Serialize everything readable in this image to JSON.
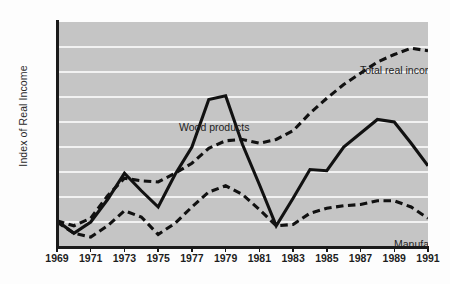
{
  "chart_data": {
    "type": "line",
    "title": "",
    "subtitle": "",
    "xlabel": "",
    "ylabel": "Index of Real Income",
    "xlim": [
      1969,
      1991
    ],
    "ylim": [
      0.9,
      1.8
    ],
    "grid": true,
    "gridline_axis": "y",
    "legend_position": "inline-annotations",
    "background_color": "#c5c5c5",
    "gridline_color": "#f2f2f2",
    "line_color": "#111111",
    "x": [
      1969,
      1970,
      1971,
      1972,
      1973,
      1974,
      1975,
      1976,
      1977,
      1978,
      1979,
      1980,
      1981,
      1982,
      1983,
      1984,
      1985,
      1986,
      1987,
      1988,
      1989,
      1990,
      1991
    ],
    "x_tick_labels": [
      "1969",
      "1971",
      "1973",
      "1975",
      "1977",
      "1979",
      "1981",
      "1983",
      "1985",
      "1987",
      "1989",
      "1991"
    ],
    "y_tick_labels": [
      "0.9",
      "1.0",
      "1.1",
      "1.2",
      "1.3",
      "1.4",
      "1.5",
      "1.6",
      "1.7",
      "1.8"
    ],
    "series": [
      {
        "name": "Total real income",
        "style": "dashed",
        "label_text": "Total real income",
        "values": [
          1.005,
          0.985,
          1.015,
          1.105,
          1.175,
          1.165,
          1.16,
          1.195,
          1.235,
          1.295,
          1.325,
          1.33,
          1.315,
          1.33,
          1.365,
          1.435,
          1.495,
          1.55,
          1.595,
          1.64,
          1.67,
          1.695,
          1.685
        ]
      },
      {
        "name": "Wood products",
        "style": "solid",
        "label_text": "Wood products",
        "values": [
          1.005,
          0.955,
          1.0,
          1.09,
          1.195,
          1.125,
          1.06,
          1.19,
          1.3,
          1.49,
          1.505,
          1.31,
          1.15,
          0.985,
          1.095,
          1.21,
          1.205,
          1.3,
          1.355,
          1.41,
          1.4,
          1.315,
          1.225
        ]
      },
      {
        "name": "Manufacturing",
        "style": "dashed",
        "label_text": "Manufacturing",
        "values": [
          1.0,
          0.955,
          0.94,
          0.985,
          1.045,
          1.02,
          0.95,
          0.995,
          1.06,
          1.12,
          1.145,
          1.11,
          1.05,
          0.985,
          0.99,
          1.035,
          1.055,
          1.065,
          1.07,
          1.085,
          1.085,
          1.06,
          1.015
        ]
      }
    ]
  },
  "axes": {
    "y_title": "Index of Real Income"
  }
}
